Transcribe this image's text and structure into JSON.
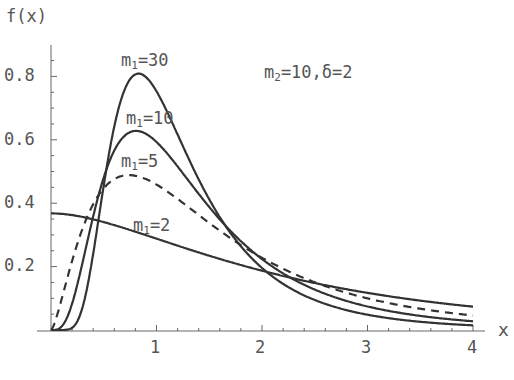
{
  "chart_data": {
    "type": "line",
    "title": "",
    "xlabel": "x",
    "ylabel": "f(x)",
    "xlim": [
      0,
      4
    ],
    "ylim": [
      0,
      0.88
    ],
    "x_ticks": [
      "1",
      "2",
      "3",
      "4"
    ],
    "y_ticks": [
      "0.2",
      "0.4",
      "0.6",
      "0.8"
    ],
    "grid": false,
    "legend": "inline labels",
    "annotation": "m2=10, δ=2",
    "params": {
      "m2": 10,
      "delta": 2
    },
    "series": [
      {
        "name": "m1=30",
        "m1": 30,
        "style": "solid",
        "peak": {
          "x": 0.84,
          "y": 0.81
        },
        "at_x4": 0.016
      },
      {
        "name": "m1=10",
        "m1": 10,
        "style": "solid",
        "peak": {
          "x": 0.8,
          "y": 0.63
        },
        "at_x4": 0.025
      },
      {
        "name": "m1=5",
        "m1": 5,
        "style": "dashed",
        "peak": {
          "x": 0.76,
          "y": 0.49
        },
        "at_x4": 0.044
      },
      {
        "name": "m1=2",
        "m1": 2,
        "style": "solid",
        "at_x0": 0.37,
        "at_x4": 0.076
      }
    ]
  },
  "labels": {
    "yaxis": "f(x)",
    "xaxis": "x",
    "annotation_m": "m",
    "annotation_sub": "2",
    "annotation_rest": "=10,δ=2",
    "series_labels": [
      {
        "m": "m",
        "sub": "1",
        "rest": "=30"
      },
      {
        "m": "m",
        "sub": "1",
        "rest": "=10"
      },
      {
        "m": "m",
        "sub": "1",
        "rest": "=5"
      },
      {
        "m": "m",
        "sub": "1",
        "rest": "=2"
      }
    ],
    "xticks": [
      "1",
      "2",
      "3",
      "4"
    ],
    "yticks": [
      "0.2",
      "0.4",
      "0.6",
      "0.8"
    ]
  },
  "style": {
    "line_color": "#333333",
    "axis_color": "#666666",
    "text_color": "#555555"
  }
}
